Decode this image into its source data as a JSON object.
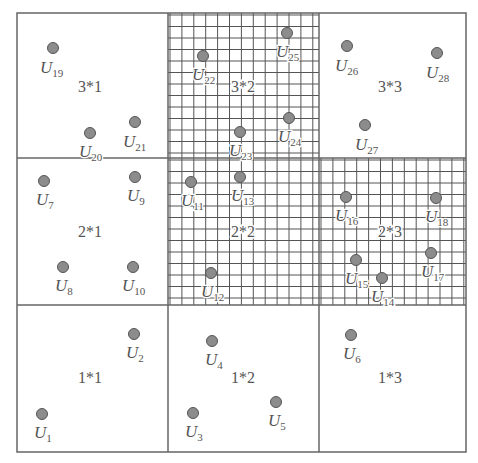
{
  "diagram": {
    "frame": {
      "x": 17,
      "y": 13,
      "width": 449,
      "height": 439
    },
    "columns_x": [
      17,
      168,
      319,
      466
    ],
    "rows_y": [
      13,
      158,
      305,
      452
    ],
    "colors": {
      "line": "#666666",
      "grid": "#555555",
      "dot_fill": "#8c8c8c",
      "dot_stroke": "#555555",
      "text": "#555555"
    },
    "grid_spacing": {
      "dx": 11.9,
      "dy": 11.5
    },
    "cells": [
      {
        "id": "3*1",
        "label": "3*1",
        "col": 0,
        "row": 0,
        "hatched": false,
        "label_x": 90,
        "label_y": 92
      },
      {
        "id": "3*2",
        "label": "3*2",
        "col": 1,
        "row": 0,
        "hatched": true,
        "label_x": 243,
        "label_y": 92
      },
      {
        "id": "3*3",
        "label": "3*3",
        "col": 2,
        "row": 0,
        "hatched": false,
        "label_x": 390,
        "label_y": 92
      },
      {
        "id": "2*1",
        "label": "2*1",
        "col": 0,
        "row": 1,
        "hatched": false,
        "label_x": 90,
        "label_y": 237
      },
      {
        "id": "2*2",
        "label": "2*2",
        "col": 1,
        "row": 1,
        "hatched": true,
        "label_x": 243,
        "label_y": 237
      },
      {
        "id": "2*3",
        "label": "2*3",
        "col": 2,
        "row": 1,
        "hatched": true,
        "label_x": 390,
        "label_y": 237
      },
      {
        "id": "1*1",
        "label": "1*1",
        "col": 0,
        "row": 2,
        "hatched": false,
        "label_x": 90,
        "label_y": 383
      },
      {
        "id": "1*2",
        "label": "1*2",
        "col": 1,
        "row": 2,
        "hatched": false,
        "label_x": 243,
        "label_y": 383
      },
      {
        "id": "1*3",
        "label": "1*3",
        "col": 2,
        "row": 2,
        "hatched": false,
        "label_x": 390,
        "label_y": 383
      }
    ],
    "users": [
      {
        "name": "U",
        "sub": "1",
        "x": 42,
        "y": 414,
        "lx": 34,
        "ly": 438
      },
      {
        "name": "U",
        "sub": "2",
        "x": 134,
        "y": 334,
        "lx": 126,
        "ly": 358
      },
      {
        "name": "U",
        "sub": "3",
        "x": 193,
        "y": 413,
        "lx": 185,
        "ly": 437
      },
      {
        "name": "U",
        "sub": "4",
        "x": 212,
        "y": 341,
        "lx": 205,
        "ly": 365
      },
      {
        "name": "U",
        "sub": "5",
        "x": 276,
        "y": 402,
        "lx": 268,
        "ly": 426
      },
      {
        "name": "U",
        "sub": "6",
        "x": 351,
        "y": 335,
        "lx": 343,
        "ly": 359
      },
      {
        "name": "U",
        "sub": "7",
        "x": 44,
        "y": 181,
        "lx": 36,
        "ly": 205
      },
      {
        "name": "U",
        "sub": "8",
        "x": 63,
        "y": 267,
        "lx": 55,
        "ly": 291
      },
      {
        "name": "U",
        "sub": "9",
        "x": 135,
        "y": 177,
        "lx": 127,
        "ly": 201
      },
      {
        "name": "U",
        "sub": "10",
        "x": 133,
        "y": 267,
        "lx": 122,
        "ly": 291
      },
      {
        "name": "U",
        "sub": "11",
        "x": 191,
        "y": 182,
        "lx": 181,
        "ly": 206
      },
      {
        "name": "U",
        "sub": "12",
        "x": 211,
        "y": 273,
        "lx": 201,
        "ly": 297
      },
      {
        "name": "U",
        "sub": "13",
        "x": 240,
        "y": 177,
        "lx": 231,
        "ly": 201
      },
      {
        "name": "U",
        "sub": "14",
        "x": 382,
        "y": 278,
        "lx": 371,
        "ly": 302
      },
      {
        "name": "U",
        "sub": "15",
        "x": 356,
        "y": 260,
        "lx": 345,
        "ly": 284
      },
      {
        "name": "U",
        "sub": "16",
        "x": 346,
        "y": 197,
        "lx": 335,
        "ly": 221
      },
      {
        "name": "U",
        "sub": "17",
        "x": 431,
        "y": 253,
        "lx": 421,
        "ly": 277
      },
      {
        "name": "U",
        "sub": "18",
        "x": 436,
        "y": 198,
        "lx": 425,
        "ly": 222
      },
      {
        "name": "U",
        "sub": "19",
        "x": 53,
        "y": 48,
        "lx": 40,
        "ly": 73
      },
      {
        "name": "U",
        "sub": "20",
        "x": 90,
        "y": 133,
        "lx": 79,
        "ly": 157
      },
      {
        "name": "U",
        "sub": "21",
        "x": 135,
        "y": 122,
        "lx": 123,
        "ly": 147
      },
      {
        "name": "U",
        "sub": "22",
        "x": 203,
        "y": 56,
        "lx": 192,
        "ly": 80
      },
      {
        "name": "U",
        "sub": "23",
        "x": 240,
        "y": 132,
        "lx": 229,
        "ly": 156
      },
      {
        "name": "U",
        "sub": "24",
        "x": 289,
        "y": 118,
        "lx": 278,
        "ly": 142
      },
      {
        "name": "U",
        "sub": "25",
        "x": 287,
        "y": 33,
        "lx": 276,
        "ly": 57
      },
      {
        "name": "U",
        "sub": "26",
        "x": 347,
        "y": 46,
        "lx": 335,
        "ly": 71
      },
      {
        "name": "U",
        "sub": "27",
        "x": 365,
        "y": 125,
        "lx": 355,
        "ly": 150
      },
      {
        "name": "U",
        "sub": "28",
        "x": 437,
        "y": 53,
        "lx": 426,
        "ly": 78
      }
    ]
  }
}
